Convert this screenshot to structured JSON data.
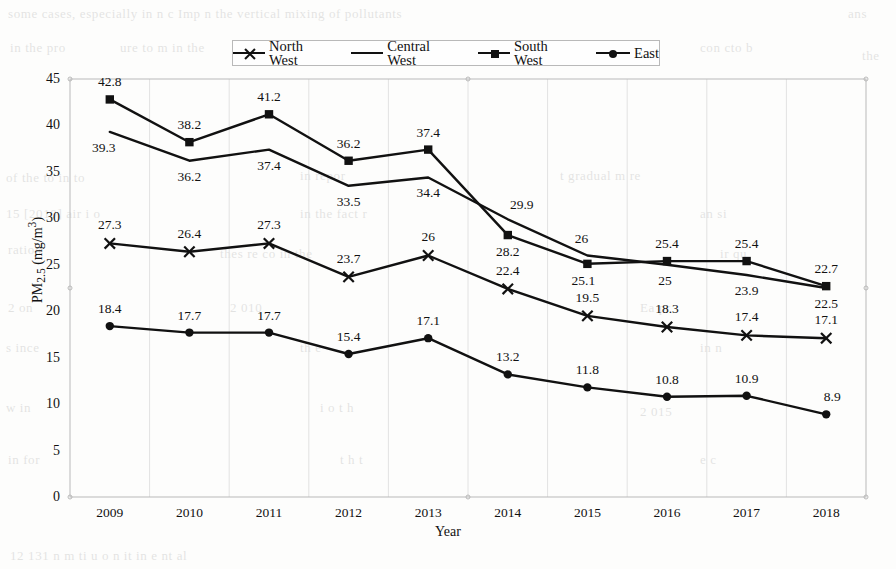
{
  "legend": {
    "position": "top-center",
    "entries": [
      {
        "label": "North West",
        "marker": "cross"
      },
      {
        "label": "Central West",
        "marker": "none"
      },
      {
        "label": "South West",
        "marker": "square"
      },
      {
        "label": "East",
        "marker": "circle"
      }
    ]
  },
  "axes": {
    "xlabel": "Year",
    "ylabel": "PM2.5 (mg/m3)",
    "ylabel_html": "PM<sub>2.5</sub> (mg/m<sup>3</sup>)",
    "yticks": [
      "0",
      "5",
      "10",
      "15",
      "20",
      "25",
      "30",
      "35",
      "40",
      "45"
    ],
    "xticks": [
      "2009",
      "2010",
      "2011",
      "2012",
      "2013",
      "2014",
      "2015",
      "2016",
      "2017",
      "2018"
    ]
  },
  "colors": {
    "series": "#111111",
    "axis": "#b9b9b9",
    "grid": "#e2e2e2",
    "background": "#fdfdfc"
  },
  "bleed_text": [
    {
      "t": "some cases, especially in    n  c  Imp   n   the vertical mixing of pollutants",
      "x": 8,
      "y": 6
    },
    {
      "t": "ans",
      "x": 848,
      "y": 6
    },
    {
      "t": "in the   pro",
      "x": 10,
      "y": 40
    },
    {
      "t": "ure to  m    in  the",
      "x": 120,
      "y": 40
    },
    {
      "t": "con    cto  b",
      "x": 700,
      "y": 40
    },
    {
      "t": "the",
      "x": 862,
      "y": 48
    },
    {
      "t": "of the    to   in   to",
      "x": 6,
      "y": 170
    },
    {
      "t": "in   repor",
      "x": 300,
      "y": 168
    },
    {
      "t": "t    gradual   m   re",
      "x": 560,
      "y": 168
    },
    {
      "t": "15 [2010]  air  i     o",
      "x": 6,
      "y": 206
    },
    {
      "t": "in  the   fact   r",
      "x": 300,
      "y": 206
    },
    {
      "t": "an    si",
      "x": 700,
      "y": 206
    },
    {
      "t": "ration",
      "x": 8,
      "y": 242
    },
    {
      "t": "thes   re   co   in  the",
      "x": 220,
      "y": 246
    },
    {
      "t": "ir  qu",
      "x": 720,
      "y": 246
    },
    {
      "t": "2   on",
      "x": 8,
      "y": 300
    },
    {
      "t": "2 010",
      "x": 230,
      "y": 300
    },
    {
      "t": "Ea   pr",
      "x": 640,
      "y": 300
    },
    {
      "t": "s ince",
      "x": 6,
      "y": 340
    },
    {
      "t": "th    e",
      "x": 300,
      "y": 340
    },
    {
      "t": "in  n",
      "x": 700,
      "y": 340
    },
    {
      "t": "w   in",
      "x": 6,
      "y": 400
    },
    {
      "t": "i  o    t   h",
      "x": 320,
      "y": 400
    },
    {
      "t": "2 015",
      "x": 640,
      "y": 404
    },
    {
      "t": "in   for",
      "x": 8,
      "y": 452
    },
    {
      "t": "t  h   t",
      "x": 340,
      "y": 452
    },
    {
      "t": "e   c",
      "x": 700,
      "y": 452
    },
    {
      "t": "12    131    n    m   ti   u     o  n     it   in   e   nt   al",
      "x": 10,
      "y": 548
    }
  ],
  "chart_data": {
    "type": "line",
    "title": "",
    "subtitle": "",
    "xlabel": "Year",
    "ylabel": "PM2.5 (mg/m3)",
    "categories": [
      "2009",
      "2010",
      "2011",
      "2012",
      "2013",
      "2014",
      "2015",
      "2016",
      "2017",
      "2018"
    ],
    "x": [
      2009,
      2010,
      2011,
      2012,
      2013,
      2014,
      2015,
      2016,
      2017,
      2018
    ],
    "ylim": [
      0,
      45
    ],
    "ytick_step": 5,
    "grid": "vertical-faint",
    "legend_position": "top-center",
    "series": [
      {
        "name": "North West",
        "marker": "cross",
        "values": [
          27.3,
          26.4,
          27.3,
          23.7,
          26,
          22.4,
          19.5,
          18.3,
          17.4,
          17.1
        ],
        "labels": [
          "27.3",
          "26.4",
          "27.3",
          "23.7",
          "26",
          "22.4",
          "19.5",
          "18.3",
          "17.4",
          "17.1"
        ]
      },
      {
        "name": "Central West",
        "marker": "none",
        "values": [
          39.3,
          36.2,
          37.4,
          33.5,
          34.4,
          29.9,
          26,
          25,
          23.9,
          22.5
        ],
        "labels": [
          "39.3",
          "36.2",
          "37.4",
          "33.5",
          "34.4",
          "29.9",
          "26",
          "25",
          "23.9",
          "22.5"
        ]
      },
      {
        "name": "South West",
        "marker": "square",
        "values": [
          42.8,
          38.2,
          41.2,
          36.2,
          37.4,
          28.2,
          25.1,
          25.4,
          25.4,
          22.7
        ],
        "labels": [
          "42.8",
          "38.2",
          "41.2",
          "36.2",
          "37.4",
          "28.2",
          "25.1",
          "25.4",
          "25.4",
          "22.7"
        ]
      },
      {
        "name": "East",
        "marker": "circle",
        "values": [
          18.4,
          17.7,
          17.7,
          15.4,
          17.1,
          13.2,
          11.8,
          10.8,
          10.9,
          8.9
        ],
        "labels": [
          "18.4",
          "17.7",
          "17.7",
          "15.4",
          "17.1",
          "13.2",
          "11.8",
          "10.8",
          "10.9",
          "8.9"
        ]
      }
    ]
  }
}
